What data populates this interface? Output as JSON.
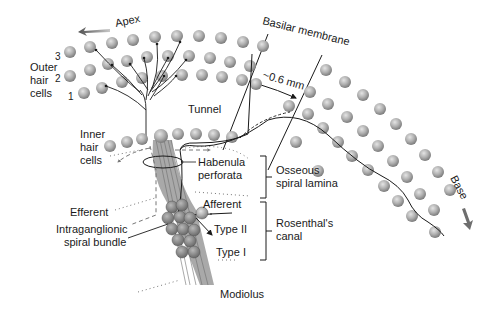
{
  "diagram": {
    "labels": {
      "apex": "Apex",
      "base": "Base",
      "basilar_membrane": "Basilar membrane",
      "width_measure": "~0.6 mm",
      "outer_hair_cells_line1": "Outer",
      "outer_hair_cells_line2": "hair",
      "outer_hair_cells_line3": "cells",
      "row_3": "3",
      "row_2": "2",
      "row_1": "1",
      "tunnel": "Tunnel",
      "inner_hair_cells_line1": "Inner",
      "inner_hair_cells_line2": "hair",
      "inner_hair_cells_line3": "cells",
      "habenula_line1": "Habenula",
      "habenula_line2": "perforata",
      "osseous_line1": "Osseous",
      "osseous_line2": "spiral lamina",
      "afferent": "Afferent",
      "efferent": "Efferent",
      "intraganglionic_line1": "Intraganglionic",
      "intraganglionic_line2": "spiral bundle",
      "type_ii": "Type II",
      "type_i": "Type I",
      "rosenthal_line1": "Rosenthal's",
      "rosenthal_line2": "canal",
      "modiolus": "Modiolus"
    },
    "colors": {
      "cell_fill": "#a8a8a8",
      "cell_highlight": "#e0e0e0",
      "line": "#1a1a1a",
      "dotted": "#555555",
      "arrow_gray": "#707070"
    }
  }
}
